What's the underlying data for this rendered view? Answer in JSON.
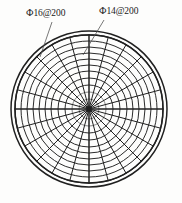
{
  "drawing": {
    "title": "Circular slab radial reinforcement plan",
    "background_color": "#fdfdfc",
    "ink_color": "#202020",
    "labels": [
      {
        "id": "phi16",
        "text": "Ф16@200",
        "bar_symbol": "Ф",
        "bar_diameter_mm": 16,
        "spacing_mm": 200,
        "position": "upper-left",
        "leader_from": [
          52,
          22
        ],
        "leader_to": [
          40,
          57
        ]
      },
      {
        "id": "phi14",
        "text": "Ф14@200",
        "bar_symbol": "Ф",
        "bar_diameter_mm": 14,
        "spacing_mm": 200,
        "position": "upper-right",
        "leader_from": [
          104,
          20
        ],
        "leader_to": [
          83,
          55
        ]
      }
    ],
    "geometry": {
      "center": [
        89,
        109
      ],
      "outer_radius": 78,
      "outer_ring_radius": 74,
      "ring_count": 10,
      "ring_radii": [
        74,
        68,
        62,
        56,
        50,
        44,
        38,
        31,
        24,
        17,
        10
      ],
      "spoke_count": 24,
      "spoke_step_degrees": 15,
      "axis_spokes_emphasized": true
    }
  }
}
